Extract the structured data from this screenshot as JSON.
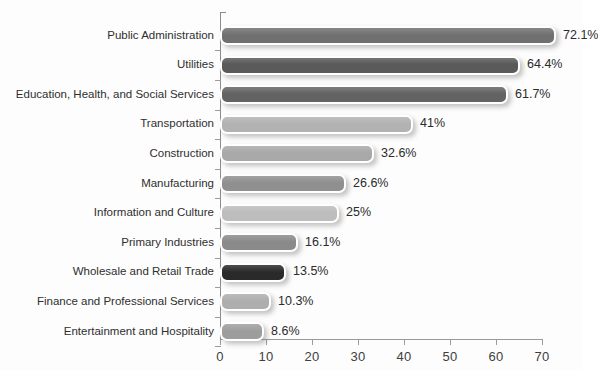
{
  "chart_data": {
    "type": "bar",
    "orientation": "horizontal",
    "title": "",
    "xlabel": "",
    "ylabel": "",
    "xlim": [
      0,
      70
    ],
    "xticks": [
      0,
      10,
      20,
      30,
      40,
      50,
      60,
      70
    ],
    "xtick_labels": [
      "0",
      "10",
      "20",
      "30",
      "40",
      "50",
      "60",
      "70"
    ],
    "grid": false,
    "legend": "none",
    "value_unit": "%",
    "categories": [
      "Public Administration",
      "Utilities",
      "Education, Health, and Social Services",
      "Transportation",
      "Construction",
      "Manufacturing",
      "Information and Culture",
      "Primary Industries",
      "Wholesale and Retail Trade",
      "Finance and Professional Services",
      "Entertainment and Hospitality"
    ],
    "values": [
      72.1,
      64.4,
      61.7,
      41,
      32.6,
      26.6,
      25,
      16.1,
      13.5,
      10.3,
      8.6
    ],
    "value_labels": [
      "72.1%",
      "64.4%",
      "61.7%",
      "41%",
      "32.6%",
      "26.6%",
      "25%",
      "16.1%",
      "13.5%",
      "10.3%",
      "8.6%"
    ],
    "bar_colors": [
      "#707070",
      "#5a5a5a",
      "#636363",
      "#b2b2b2",
      "#a8a8a8",
      "#8f8f8f",
      "#bdbdbd",
      "#8a8a8a",
      "#2a2a2a",
      "#aeaeae",
      "#9d9d9d"
    ]
  },
  "title_sliver": {
    "text": ""
  }
}
